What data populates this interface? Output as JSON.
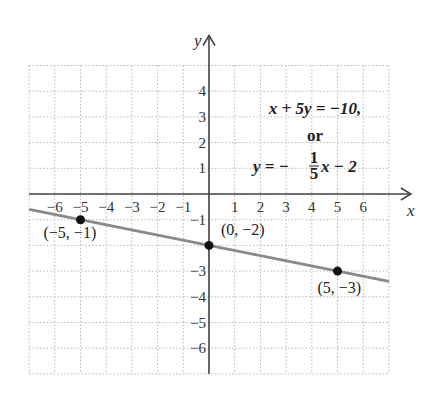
{
  "chart_data": {
    "type": "line",
    "title": "",
    "xlabel": "x",
    "ylabel": "y",
    "xlim": [
      -7,
      7
    ],
    "ylim": [
      -7,
      5
    ],
    "grid": true,
    "x_ticks": [
      "-6",
      "-5",
      "-4",
      "-3",
      "-2",
      "-1",
      "1",
      "2",
      "3",
      "4",
      "5",
      "6"
    ],
    "y_ticks": [
      "4",
      "3",
      "2",
      "1",
      "-1",
      "-3",
      "-4",
      "-5",
      "-6"
    ],
    "series": [
      {
        "name": "x + 5y = -10",
        "equation": "y = -1/5 x - 2",
        "slope": -0.2,
        "intercept": -2,
        "x": [
          -7,
          7
        ],
        "y": [
          -0.6,
          -3.4
        ]
      }
    ],
    "points": [
      {
        "x": -5,
        "y": -1,
        "label": "(−5, −1)"
      },
      {
        "x": 0,
        "y": -2,
        "label": "(0, −2)"
      },
      {
        "x": 5,
        "y": -3,
        "label": "(5, −3)"
      }
    ],
    "annotations": {
      "line1": "x + 5y = −10,",
      "line2": "or",
      "line3_prefix": "y = −",
      "frac_num": "1",
      "frac_den": "5",
      "line3_suffix": "x − 2"
    },
    "colors": {
      "line": "#8a8a8a",
      "axis": "#444444",
      "grid": "#b8b8b8",
      "point": "#111111"
    }
  }
}
